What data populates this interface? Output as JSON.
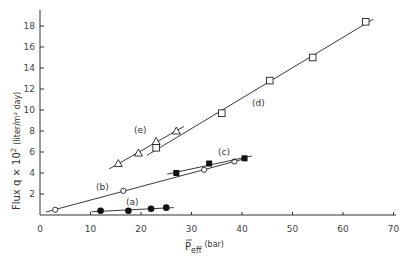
{
  "chart_data": {
    "type": "scatter",
    "title": "",
    "xlabel": "P̄eff (bar)",
    "ylabel": "Flux q × 10² (liter/m² day)",
    "xlim": [
      0,
      70
    ],
    "ylim": [
      0,
      19
    ],
    "xticks": [
      0,
      10,
      20,
      30,
      40,
      50,
      60,
      70
    ],
    "yticks": [
      2,
      4,
      6,
      8,
      10,
      12,
      14,
      16,
      18
    ],
    "grid": false,
    "series": [
      {
        "name": "(a)",
        "marker": "filled-circle",
        "x": [
          12,
          17.5,
          22,
          25
        ],
        "y": [
          0.4,
          0.4,
          0.6,
          0.7
        ]
      },
      {
        "name": "(b)",
        "marker": "open-circle",
        "x": [
          3,
          16.5,
          32.5,
          38.5
        ],
        "y": [
          0.5,
          2.3,
          4.3,
          5.1
        ]
      },
      {
        "name": "(c)",
        "marker": "filled-square",
        "x": [
          27,
          33.5,
          40.5
        ],
        "y": [
          4.0,
          4.9,
          5.4
        ]
      },
      {
        "name": "(d)",
        "marker": "open-square",
        "x": [
          23,
          36,
          45.5,
          54,
          64.5
        ],
        "y": [
          6.4,
          9.7,
          12.8,
          15.0,
          18.4
        ]
      },
      {
        "name": "(e)",
        "marker": "open-triangle",
        "x": [
          15.5,
          19.5,
          23,
          27
        ],
        "y": [
          4.9,
          5.9,
          7.0,
          8.0
        ]
      }
    ]
  },
  "labels": {
    "ylabel_main": "Flux q × 10",
    "ylabel_sup": "2",
    "ylabel_units": "(liter/m² day)",
    "xlabel_main": "P",
    "xlabel_sub": "eff",
    "xlabel_units": "(bar)",
    "a": "(a)",
    "b": "(b)",
    "c": "(c)",
    "d": "(d)",
    "e": "(e)"
  }
}
